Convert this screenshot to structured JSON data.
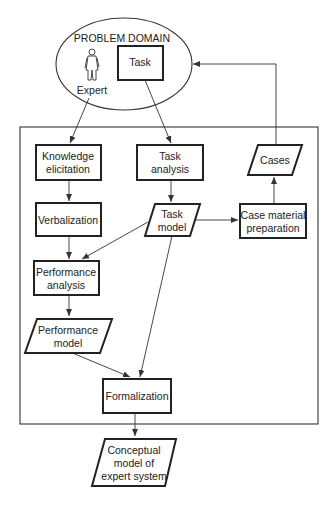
{
  "diagram": {
    "problem_domain": {
      "title": "PROBLEM DOMAIN",
      "expert_label": "Expert",
      "task_label": "Task"
    },
    "nodes": {
      "knowledge_elicitation": [
        "Knowledge",
        "elicitation"
      ],
      "task_analysis": [
        "Task",
        "analysis"
      ],
      "cases": [
        "Cases"
      ],
      "verbalization": [
        "Verbalization"
      ],
      "task_model": [
        "Task",
        "model"
      ],
      "case_material_preparation": [
        "Case material",
        "preparation"
      ],
      "performance_analysis": [
        "Performance",
        "analysis"
      ],
      "performance_model": [
        "Performance",
        "model"
      ],
      "formalization": [
        "Formalization"
      ],
      "conceptual_model": [
        "Conceptual",
        "model of",
        "expert system"
      ]
    },
    "edges": [
      {
        "from": "expert",
        "to": "knowledge_elicitation"
      },
      {
        "from": "task",
        "to": "task_analysis"
      },
      {
        "from": "knowledge_elicitation",
        "to": "verbalization"
      },
      {
        "from": "task_analysis",
        "to": "task_model"
      },
      {
        "from": "task_model",
        "to": "case_material_preparation"
      },
      {
        "from": "case_material_preparation",
        "to": "cases"
      },
      {
        "from": "cases",
        "to": "problem_domain"
      },
      {
        "from": "verbalization",
        "to": "performance_analysis"
      },
      {
        "from": "task_model",
        "to": "performance_analysis"
      },
      {
        "from": "performance_analysis",
        "to": "performance_model"
      },
      {
        "from": "performance_model",
        "to": "formalization"
      },
      {
        "from": "task_model",
        "to": "formalization"
      },
      {
        "from": "formalization",
        "to": "conceptual_model"
      }
    ]
  }
}
